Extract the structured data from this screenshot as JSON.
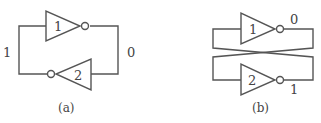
{
  "diagram_a": {
    "caption": "(a)",
    "gates": [
      {
        "id": "inverter-1",
        "label": "1",
        "direction": "right"
      },
      {
        "id": "inverter-2",
        "label": "2",
        "direction": "left"
      }
    ],
    "left_node_value": "1",
    "right_node_value": "0"
  },
  "diagram_b": {
    "caption": "(b)",
    "gates": [
      {
        "id": "inverter-1",
        "label": "1",
        "direction": "right"
      },
      {
        "id": "inverter-2",
        "label": "2",
        "direction": "right"
      }
    ],
    "output_1_value": "0",
    "output_2_value": "1"
  },
  "colors": {
    "line": "#555555",
    "text": "#444444",
    "background": "#ffffff"
  }
}
